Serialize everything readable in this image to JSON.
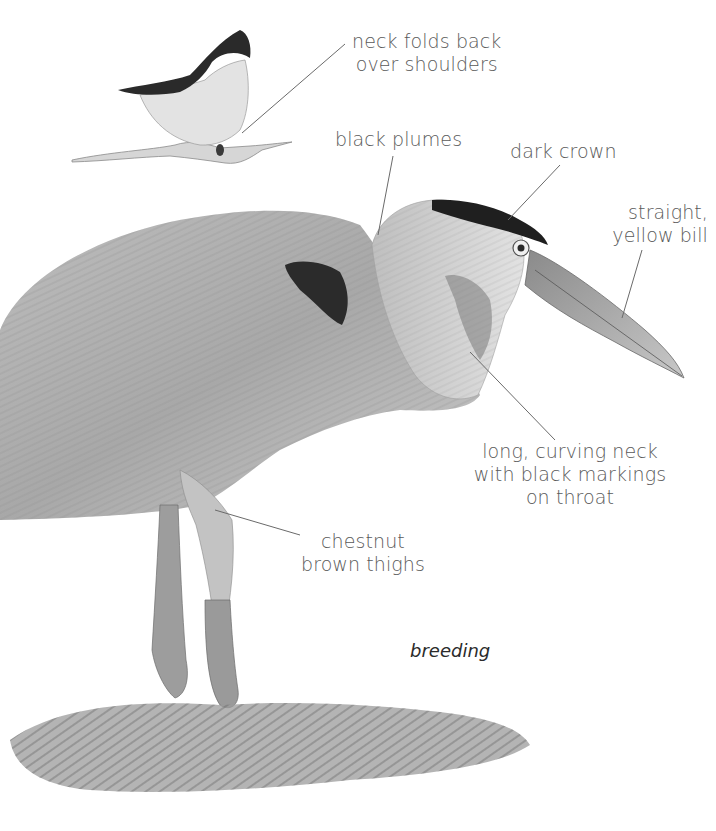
{
  "figure": {
    "caption": "breeding",
    "colors": {
      "background": "#ffffff",
      "label_text": "#5a5a5a",
      "caption_text": "#2b2b2b",
      "leader_line": "#6a6a6a",
      "plumage_light": "#d4d4d4",
      "plumage_mid": "#9a9a9a",
      "plumage_dark": "#2a2a2a"
    }
  },
  "labels": {
    "neck_folds": {
      "line1": "neck folds back",
      "line2": "over shoulders"
    },
    "black_plumes": {
      "line1": "black plumes"
    },
    "dark_crown": {
      "line1": "dark crown"
    },
    "bill": {
      "line1": "straight,",
      "line2": "yellow bill"
    },
    "neck": {
      "line1": "long, curving neck",
      "line2": "with black markings",
      "line3": "on throat"
    },
    "thighs": {
      "line1": "chestnut",
      "line2": "brown thighs"
    }
  }
}
